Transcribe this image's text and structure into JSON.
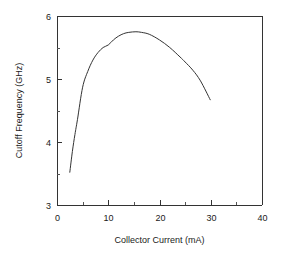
{
  "chart_data": {
    "type": "line",
    "title": "",
    "subtitle": "",
    "xlabel": "Collector Current (mA)",
    "ylabel": "Cutoff Frequency (GHz)",
    "xlim": [
      0,
      40
    ],
    "ylim": [
      3,
      6
    ],
    "xticks": [
      0,
      10,
      20,
      30,
      40
    ],
    "xtick_labels": [
      "0",
      "10",
      "20",
      "30",
      "40"
    ],
    "xminor_ticks": [
      5,
      15,
      25,
      35
    ],
    "yticks": [
      3,
      4,
      5,
      6
    ],
    "ytick_labels": [
      "3",
      "4",
      "5",
      "6"
    ],
    "yminor_ticks": [
      3.5,
      4.5,
      5.5
    ],
    "grid": false,
    "legend": false,
    "legend_position": "none",
    "line_color": "#333333",
    "background_color": "#ffffff",
    "frame": "box",
    "series": [
      {
        "name": "Cutoff frequency vs collector current",
        "x": [
          2.5,
          3.0,
          3.5,
          4.0,
          5.0,
          6.0,
          7.0,
          8.0,
          9.0,
          10.0,
          11.0,
          12.0,
          13.0,
          14.0,
          15.4,
          16.5,
          18.0,
          20.0,
          22.0,
          24.0,
          25.0,
          26.5,
          28.0,
          29.9
        ],
        "y": [
          3.52,
          3.85,
          4.12,
          4.36,
          4.87,
          5.12,
          5.3,
          5.42,
          5.5,
          5.54,
          5.62,
          5.68,
          5.72,
          5.74,
          5.75,
          5.74,
          5.71,
          5.62,
          5.5,
          5.35,
          5.27,
          5.14,
          4.97,
          4.67
        ]
      }
    ],
    "annotations": []
  }
}
